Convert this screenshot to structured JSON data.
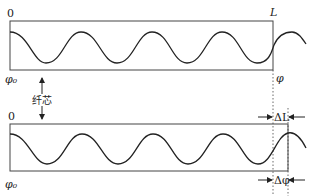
{
  "diagram": {
    "title": "",
    "top_panel": {
      "start_label": "0",
      "end_label": "L",
      "phase_start_label": "φ₀",
      "phase_end_label": "φ"
    },
    "bottom_panel": {
      "start_label": "0",
      "phase_start_label": "φ₀",
      "delta_length_label": "ΔL",
      "delta_phase_label": "Δφ"
    },
    "core_label": "纤芯",
    "colors": {
      "line": "#333333",
      "wave": "#222222",
      "text": "#222222"
    }
  }
}
